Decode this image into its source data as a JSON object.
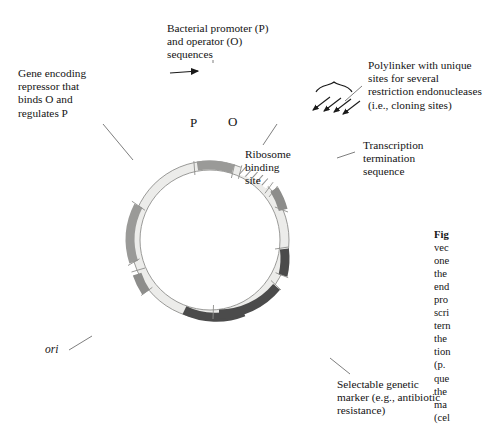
{
  "figure": {
    "type": "plasmid-expression-vector-diagram",
    "title_visible": false
  },
  "ring": {
    "center": {
      "x": 210,
      "y": 240
    },
    "outer_radius": 79,
    "inner_radius": 70,
    "backbone_color": "#ececea",
    "outline_color": "#8a8a88",
    "segments": [
      {
        "name": "repressor-gene",
        "label": "Gene encoding repressor",
        "start_deg": 196,
        "end_deg": 258,
        "fill": "#9a9a98",
        "pattern": "solid"
      },
      {
        "name": "promoter",
        "label": "P",
        "start_deg": 288,
        "end_deg": 300,
        "fill": "#9a9a98",
        "pattern": "solid"
      },
      {
        "name": "operator",
        "label": "O",
        "start_deg": 308,
        "end_deg": 322,
        "fill": "#ffffff",
        "pattern": "hatch"
      },
      {
        "name": "ribosome-binding-site",
        "label": "Ribosome binding site",
        "start_deg": 336,
        "end_deg": 350,
        "fill": "#8d8d8b",
        "pattern": "solid"
      },
      {
        "name": "polylinker",
        "label": "Polylinker",
        "start_deg": 352,
        "end_deg": 10,
        "fill": "#ececea",
        "pattern": "solid"
      },
      {
        "name": "transcription-termination",
        "label": "Transcription termination sequence",
        "start_deg": 16,
        "end_deg": 28,
        "fill": "#4b4b4b",
        "pattern": "solid"
      },
      {
        "name": "selectable-marker",
        "label": "Selectable genetic marker",
        "start_deg": 50,
        "end_deg": 98,
        "fill": "#4b4b4b",
        "pattern": "solid"
      },
      {
        "name": "ori",
        "label": "ori",
        "start_deg": 148,
        "end_deg": 164,
        "fill": "#8d8d8b",
        "pattern": "solid"
      }
    ]
  },
  "labels": {
    "promoter_operator": {
      "lines": [
        "Bacterial promoter (P)",
        "and operator (O)",
        "sequences"
      ]
    },
    "repressor_gene": {
      "lines": [
        "Gene encoding",
        "repressor that",
        "binds O and",
        "regulates P"
      ]
    },
    "polylinker": {
      "lines": [
        "Polylinker with unique",
        "sites for several",
        "restriction endonucleases",
        "(i.e., cloning sites)"
      ]
    },
    "ribosome_binding_site": {
      "lines": [
        "Ribosome",
        "binding",
        "site"
      ]
    },
    "transcription_termination": {
      "lines": [
        "Transcription",
        "termination",
        "sequence"
      ]
    },
    "selectable_marker": {
      "lines": [
        "Selectable genetic",
        "marker (e.g., antibiotic",
        "resistance)"
      ]
    },
    "ring_letters": {
      "promoter": "P",
      "operator": "O"
    },
    "origin": "ori"
  },
  "caption": {
    "lines": [
      "Fig",
      "vec",
      "one",
      "the",
      "end",
      "pro",
      "scri",
      "tern",
      "the",
      "tion",
      "(p.",
      "que",
      "the",
      "ma",
      "(cel"
    ]
  },
  "colors": {
    "page_background": "#ffffff",
    "text": "#141414",
    "leader_line": "#6f6f6f",
    "dark_segment": "#4b4b4b",
    "mid_segment": "#9a9a98",
    "light_backbone": "#ececea"
  }
}
